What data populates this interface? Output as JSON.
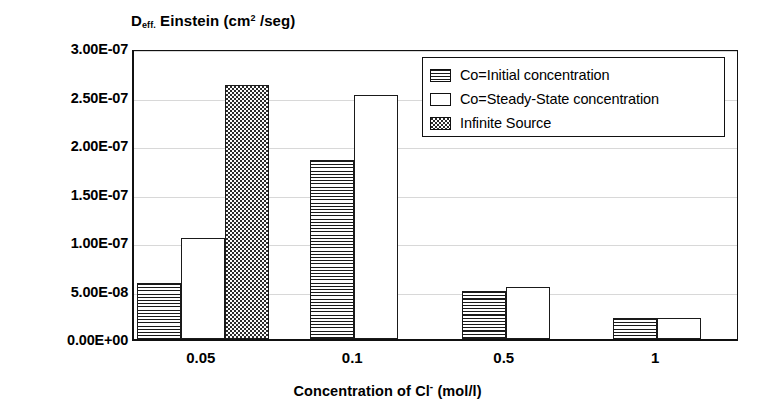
{
  "chart_data": {
    "type": "bar",
    "title": "",
    "ylabel": "Deff. Einstein (cm2 /seg)",
    "ylabel_parts": {
      "main_pre": "D",
      "sub": "eff.",
      "mid": " Einstein (cm",
      "sup": "2",
      "post": " /seg)"
    },
    "xlabel": "Concentration of Cl- (mol/l)",
    "xlabel_parts": {
      "pre": "Concentration of Cl",
      "sup": "-",
      "post": " (mol/l)"
    },
    "categories": [
      "0.05",
      "0.1",
      "0.5",
      "1"
    ],
    "ylim": [
      0,
      3e-07
    ],
    "yticks": [
      0,
      5e-08,
      1e-07,
      1.5e-07,
      2e-07,
      2.5e-07,
      3e-07
    ],
    "ytick_labels": [
      "0.00E+00",
      "5.00E-08",
      "1.00E-07",
      "1.50E-07",
      "2.00E-07",
      "2.50E-07",
      "3.00E-07"
    ],
    "grid": true,
    "legend_position": "upper-right",
    "series": [
      {
        "name": "Co=Initial concentration",
        "pattern": "horizontal-stripes",
        "values": [
          5.8e-08,
          1.85e-07,
          4.9e-08,
          2.2e-08
        ]
      },
      {
        "name": "Co=Steady-State concentration",
        "pattern": "empty",
        "values": [
          1.04e-07,
          2.52e-07,
          5.4e-08,
          2.2e-08
        ]
      },
      {
        "name": "Infinite Source",
        "pattern": "dotted",
        "values": [
          2.62e-07,
          null,
          null,
          null
        ]
      }
    ]
  },
  "colors": {
    "ink": "#111111",
    "grid": "#d8d8d8",
    "background": "#ffffff"
  }
}
